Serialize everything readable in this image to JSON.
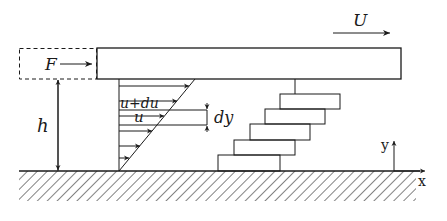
{
  "labels": {
    "force": "F",
    "plate_velocity": "U",
    "gap_height": "h",
    "velocity_upper": "u+du",
    "velocity_lower": "u",
    "layer_thickness": "dy",
    "axis_y": "y",
    "axis_x": "x"
  },
  "colors": {
    "ink": "#1a1a1a",
    "background": "#ffffff"
  },
  "layers": {
    "count": 5
  },
  "profile_arrows": {
    "count": 6
  }
}
